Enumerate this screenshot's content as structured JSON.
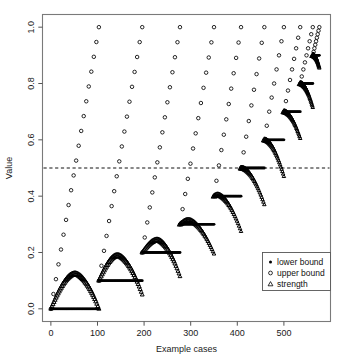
{
  "chart_data": {
    "type": "line",
    "title": "",
    "xlabel": "Example cases",
    "ylabel": "Value",
    "xlim": [
      -18,
      600
    ],
    "ylim": [
      -0.045,
      1.045
    ],
    "xticks": [
      0,
      100,
      200,
      300,
      400,
      500
    ],
    "xtick_labels": [
      "0",
      "100",
      "200",
      "300",
      "400",
      "500"
    ],
    "yticks": [
      0.0,
      0.2,
      0.4,
      0.6,
      0.8,
      1.0
    ],
    "ytick_labels": [
      "0.0",
      "0.2",
      "0.4",
      "0.6",
      "0.8",
      "1.0"
    ],
    "grid": false,
    "reference_line": {
      "orientation": "horizontal",
      "value": 0.5,
      "style": "dashed"
    },
    "legend": {
      "position": "bottom-right",
      "entries": [
        {
          "label": "lower bound",
          "marker": "filled-circle"
        },
        {
          "label": "upper bound",
          "marker": "open-circle"
        },
        {
          "label": "strength",
          "marker": "open-triangle"
        }
      ]
    },
    "series": [
      {
        "name": "lower bound",
        "marker": "filled-circle"
      },
      {
        "name": "upper bound",
        "marker": "open-circle"
      },
      {
        "name": "strength",
        "marker": "open-triangle"
      }
    ],
    "segments": [
      {
        "index": 1,
        "x_start": 0,
        "x_end": 103,
        "lower_bound": 0.0,
        "upper_start": 0.0,
        "upper_end": 1.0,
        "strength_peak": 0.125,
        "strength_peak_x": 52,
        "strength_end": 0.0
      },
      {
        "index": 2,
        "x_start": 103,
        "x_end": 196,
        "lower_bound": 0.1,
        "upper_start": 0.1,
        "upper_end": 1.0,
        "strength_peak": 0.19,
        "strength_peak_x": 143,
        "strength_end": 0.05
      },
      {
        "index": 3,
        "x_start": 196,
        "x_end": 277,
        "lower_bound": 0.2,
        "upper_start": 0.2,
        "upper_end": 1.0,
        "strength_peak": 0.245,
        "strength_peak_x": 228,
        "strength_end": 0.115
      },
      {
        "index": 4,
        "x_start": 277,
        "x_end": 350,
        "lower_bound": 0.3,
        "upper_start": 0.3,
        "upper_end": 1.0,
        "strength_peak": 0.315,
        "strength_peak_x": 295,
        "strength_end": 0.195
      },
      {
        "index": 5,
        "x_start": 350,
        "x_end": 408,
        "lower_bound": 0.4,
        "upper_start": 0.4,
        "upper_end": 1.0,
        "strength_peak": 0.405,
        "strength_peak_x": 358,
        "strength_end": 0.275
      },
      {
        "index": 6,
        "x_start": 408,
        "x_end": 458,
        "lower_bound": 0.5,
        "upper_start": 0.5,
        "upper_end": 1.0,
        "strength_peak": 0.5,
        "strength_peak_x": 410,
        "strength_end": 0.37
      },
      {
        "index": 7,
        "x_start": 458,
        "x_end": 500,
        "lower_bound": 0.6,
        "upper_start": 0.6,
        "upper_end": 1.0,
        "strength_peak": 0.6,
        "strength_peak_x": 459,
        "strength_end": 0.47
      },
      {
        "index": 8,
        "x_start": 500,
        "x_end": 535,
        "lower_bound": 0.7,
        "upper_start": 0.7,
        "upper_end": 1.0,
        "strength_peak": 0.7,
        "strength_peak_x": 501,
        "strength_end": 0.605
      },
      {
        "index": 9,
        "x_start": 535,
        "x_end": 562,
        "lower_bound": 0.8,
        "upper_start": 0.8,
        "upper_end": 1.0,
        "strength_peak": 0.8,
        "strength_peak_x": 536,
        "strength_end": 0.715
      },
      {
        "index": 10,
        "x_start": 562,
        "x_end": 576,
        "lower_bound": 0.9,
        "upper_start": 0.9,
        "upper_end": 1.0,
        "strength_peak": 0.9,
        "strength_peak_x": 563,
        "strength_end": 0.855
      }
    ]
  }
}
